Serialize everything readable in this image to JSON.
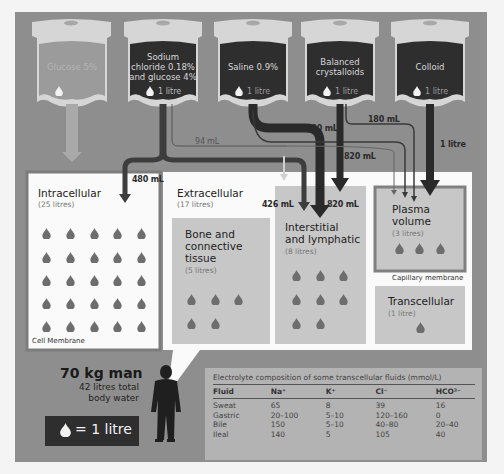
{
  "bags": [
    {
      "name": "Glucose 5%",
      "volume": "1 litre",
      "volume_visible": false
    },
    {
      "name": "Sodium chloride 0.18% and glucose 4%",
      "name_lines": [
        "Sodium",
        "chloride 0.18%",
        "and glucose 4%"
      ],
      "volume": "1 litre"
    },
    {
      "name": "Saline 0.9%",
      "volume": "1 litre"
    },
    {
      "name": "Balanced crystalloids",
      "name_lines": [
        "Balanced",
        "crystalloids"
      ],
      "volume": "1 litre"
    },
    {
      "name": "Colloid",
      "volume": "1 litre"
    }
  ],
  "flows": {
    "f94": "94 mL",
    "f180a": "180 mL",
    "f180b": "180 mL",
    "f480": "480 mL",
    "f820a": "820 mL",
    "f820b": "820 mL",
    "f426": "426 mL",
    "f1l": "1 litre"
  },
  "compartments": {
    "intracellular": {
      "title": "Intracellular",
      "sub": "(25 litres)",
      "drops": 25
    },
    "extracellular": {
      "title": "Extracellular",
      "sub": "(17 litres)"
    },
    "bone": {
      "title_lines": [
        "Bone and",
        "connective",
        "tissue"
      ],
      "sub": "(5 litres)",
      "drops": 5
    },
    "interstitial": {
      "title_lines": [
        "Interstitial",
        "and lymphatic"
      ],
      "sub": "(8 litres)",
      "drops": 8
    },
    "plasma": {
      "title_lines": [
        "Plasma",
        "volume"
      ],
      "sub": "(3 litres)",
      "drops": 3
    },
    "transcellular": {
      "title": "Transcellular",
      "sub": "(1 litre)",
      "drops": 1
    }
  },
  "labels": {
    "cell_membrane": "Cell Membrane",
    "capillary_membrane": "Capillary membrane"
  },
  "man": {
    "title": "70 kg man",
    "line1": "42 litres total",
    "line2": "body water"
  },
  "legend": {
    "text": "= 1 litre"
  },
  "table": {
    "caption": "Electrolyte composition of some transcellular fluids (mmol/L)",
    "headers": [
      "Fluid",
      "Na⁺",
      "K⁺",
      "Cl⁻",
      "HCO³⁻"
    ],
    "rows": [
      [
        "Sweat",
        "65",
        "8",
        "39",
        "16"
      ],
      [
        "Gastric",
        "20–100",
        "5–10",
        "120–160",
        "0"
      ],
      [
        "Bile",
        "150",
        "5–10",
        "40–80",
        "20–40"
      ],
      [
        "Ileal",
        "140",
        "5",
        "105",
        "40"
      ]
    ]
  },
  "colors": {
    "panel": "#8e8e8e",
    "bag_dark": "#2e2e2e",
    "bag_light": "#9b9b9b",
    "bag_frame": "#d6d6d6",
    "drop": "#6d6d6d",
    "box_light": "#c7c7c7",
    "white": "#fafafa"
  }
}
